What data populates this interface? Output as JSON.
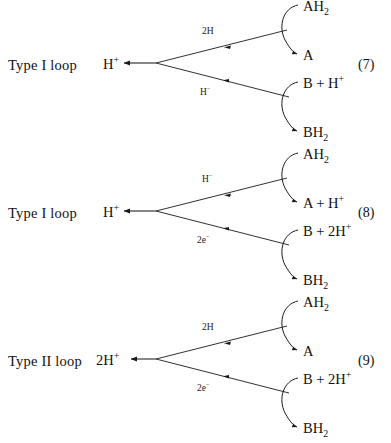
{
  "figure": {
    "name": "proton-translocating-loop-mechanisms",
    "background_color": "#ffffff",
    "ink_color": "#1a1a1a",
    "loops": [
      {
        "id": "loop-7",
        "type_label": "Type I loop",
        "left_species": "H",
        "left_species_sup": "+",
        "equation_number": "(7)",
        "upper_branch_label": "2H",
        "upper_branch_label_sup": "",
        "lower_branch_label": "H",
        "lower_branch_label_sup": "−",
        "right_species": [
          {
            "main": "AH",
            "sub": "2",
            "sup": ""
          },
          {
            "main": "A",
            "sub": "",
            "sup": ""
          },
          {
            "main": "B + H",
            "sub": "",
            "sup": "+"
          },
          {
            "main": "BH",
            "sub": "2",
            "sup": ""
          }
        ]
      },
      {
        "id": "loop-8",
        "type_label": "Type I loop",
        "left_species": "H",
        "left_species_sup": "+",
        "equation_number": "(8)",
        "upper_branch_label": "H",
        "upper_branch_label_sup": "−",
        "lower_branch_label": "2e",
        "lower_branch_label_sup": "−",
        "right_species": [
          {
            "main": "AH",
            "sub": "2",
            "sup": ""
          },
          {
            "main": "A + H",
            "sub": "",
            "sup": "+"
          },
          {
            "main": "B + 2H",
            "sub": "",
            "sup": "+"
          },
          {
            "main": "BH",
            "sub": "2",
            "sup": ""
          }
        ]
      },
      {
        "id": "loop-9",
        "type_label": "Type II loop",
        "left_species": "2H",
        "left_species_sup": "+",
        "equation_number": "(9)",
        "upper_branch_label": "2H",
        "upper_branch_label_sup": "",
        "lower_branch_label": "2e",
        "lower_branch_label_sup": "−",
        "right_species": [
          {
            "main": "AH",
            "sub": "2",
            "sup": ""
          },
          {
            "main": "A",
            "sub": "",
            "sup": ""
          },
          {
            "main": "B + 2H",
            "sub": "",
            "sup": "+"
          },
          {
            "main": "BH",
            "sub": "2",
            "sup": ""
          }
        ]
      }
    ],
    "top_clipped_remnant": "AH"
  }
}
